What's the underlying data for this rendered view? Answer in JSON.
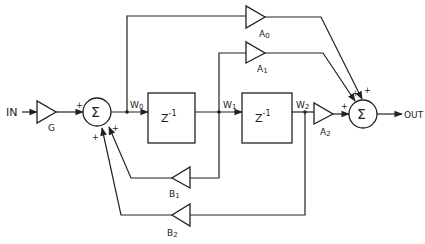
{
  "diagram": {
    "type": "second-order IIR digital filter (biquad) block diagram",
    "input_label": "IN",
    "output_label": "OUT",
    "gain": {
      "label": "G"
    },
    "input_summer": {
      "symbol": "Σ",
      "signs": [
        "+",
        "+",
        "+"
      ]
    },
    "output_summer": {
      "symbol": "Σ",
      "signs": [
        "+",
        "+",
        "+"
      ]
    },
    "delays": [
      {
        "label": "Z",
        "exponent": "-1"
      },
      {
        "label": "Z",
        "exponent": "-1"
      }
    ],
    "nodes": {
      "w0": {
        "main": "W",
        "sub": "0"
      },
      "w1": {
        "main": "W",
        "sub": "1"
      },
      "w2": {
        "main": "W",
        "sub": "2"
      }
    },
    "feedforward": [
      {
        "main": "A",
        "sub": "0"
      },
      {
        "main": "A",
        "sub": "1"
      },
      {
        "main": "A",
        "sub": "2"
      }
    ],
    "feedback": [
      {
        "main": "B",
        "sub": "1"
      },
      {
        "main": "B",
        "sub": "2"
      }
    ],
    "sign_plus": "+"
  }
}
